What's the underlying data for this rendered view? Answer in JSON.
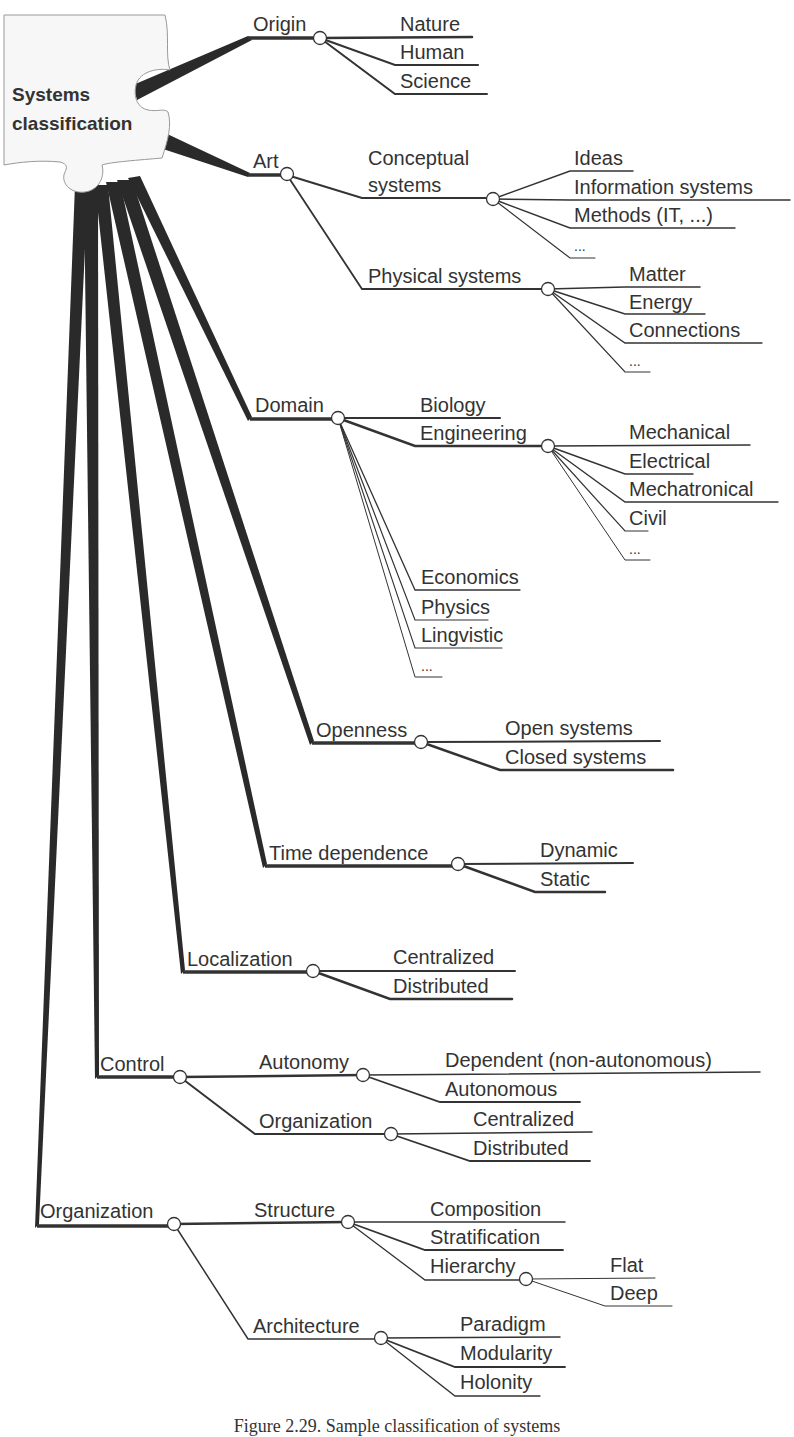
{
  "root": {
    "line1": "Systems",
    "line2": "classification"
  },
  "categories": {
    "origin": {
      "label": "Origin",
      "children": [
        "Nature",
        "Human",
        "Science"
      ]
    },
    "art": {
      "label": "Art",
      "conceptual": {
        "label_line1": "Conceptual",
        "label_line2": "systems",
        "children": [
          "Ideas",
          "Information systems",
          "Methods (IT, ...)",
          "..."
        ]
      },
      "physical": {
        "label": "Physical systems",
        "children": [
          "Matter",
          "Energy",
          "Connections",
          "..."
        ]
      }
    },
    "domain": {
      "label": "Domain",
      "biology": "Biology",
      "engineering": {
        "label": "Engineering",
        "children": [
          "Mechanical",
          "Electrical",
          "Mechatronical",
          "Civil",
          "..."
        ]
      },
      "others": [
        "Economics",
        "Physics",
        "Lingvistic",
        "..."
      ]
    },
    "openness": {
      "label": "Openness",
      "children": [
        "Open systems",
        "Closed systems"
      ]
    },
    "time_dependence": {
      "label": "Time dependence",
      "children": [
        "Dynamic",
        "Static"
      ]
    },
    "localization": {
      "label": "Localization",
      "children": [
        "Centralized",
        "Distributed"
      ]
    },
    "control": {
      "label": "Control",
      "autonomy": {
        "label": "Autonomy",
        "children": [
          "Dependent (non-autonomous)",
          "Autonomous"
        ]
      },
      "organization": {
        "label": "Organization",
        "children": [
          "Centralized",
          "Distributed"
        ]
      }
    },
    "organization": {
      "label": "Organization",
      "structure": {
        "label": "Structure",
        "children": [
          "Composition",
          "Stratification"
        ],
        "hierarchy": {
          "label": "Hierarchy",
          "children": [
            "Flat",
            "Deep"
          ]
        }
      },
      "architecture": {
        "label": "Architecture",
        "children": [
          "Paradigm",
          "Modularity",
          "Holonity"
        ]
      }
    }
  },
  "caption": "Figure 2.29. Sample classification of systems",
  "colors": {
    "line": "#333333",
    "trunk": "#2a2a2a",
    "node_fill": "#ffffff",
    "puzzle_fill": "#f7f7f7",
    "puzzle_stroke": "#999999"
  }
}
